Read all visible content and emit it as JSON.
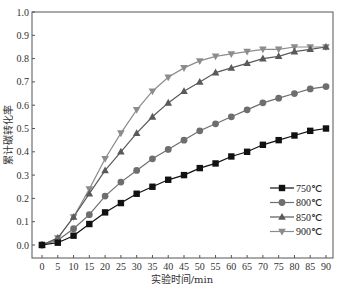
{
  "chart_data": {
    "type": "line",
    "title": "",
    "xlabel": "实验时间/min",
    "ylabel": "累计碳转化率",
    "xlim": [
      -2,
      92
    ],
    "ylim": [
      -0.05,
      1.0
    ],
    "xticks": [
      0,
      5,
      10,
      15,
      20,
      25,
      30,
      35,
      40,
      45,
      50,
      55,
      60,
      65,
      70,
      75,
      80,
      85,
      90
    ],
    "yticks": [
      0.0,
      0.1,
      0.2,
      0.3,
      0.4,
      0.5,
      0.6,
      0.7,
      0.8,
      0.9,
      1.0
    ],
    "ytick_labels": [
      "0.0",
      "0.1",
      "0.2",
      "0.3",
      "0.4",
      "0.5",
      "0.6",
      "0.7",
      "0.8",
      "0.9",
      "1.0"
    ],
    "grid": false,
    "legend_position": "bottom-right",
    "x": [
      0,
      5,
      10,
      15,
      20,
      25,
      30,
      35,
      40,
      45,
      50,
      55,
      60,
      65,
      70,
      75,
      80,
      85,
      90
    ],
    "series": [
      {
        "name": "750℃",
        "marker": "square",
        "color": "#111111",
        "values": [
          0.0,
          0.01,
          0.04,
          0.09,
          0.14,
          0.18,
          0.22,
          0.25,
          0.28,
          0.3,
          0.33,
          0.35,
          0.38,
          0.4,
          0.43,
          0.45,
          0.47,
          0.49,
          0.5
        ]
      },
      {
        "name": "800℃",
        "marker": "circle",
        "color": "#6e6e6e",
        "values": [
          0.0,
          0.02,
          0.07,
          0.13,
          0.21,
          0.27,
          0.32,
          0.37,
          0.41,
          0.45,
          0.49,
          0.52,
          0.55,
          0.58,
          0.61,
          0.63,
          0.65,
          0.67,
          0.68
        ]
      },
      {
        "name": "850℃",
        "marker": "triangle-up",
        "color": "#5a5a5a",
        "values": [
          0.0,
          0.03,
          0.12,
          0.22,
          0.32,
          0.4,
          0.48,
          0.55,
          0.61,
          0.66,
          0.7,
          0.74,
          0.76,
          0.78,
          0.8,
          0.81,
          0.83,
          0.84,
          0.85
        ]
      },
      {
        "name": "900℃",
        "marker": "triangle-down",
        "color": "#8c8c8c",
        "values": [
          0.0,
          0.03,
          0.12,
          0.24,
          0.37,
          0.48,
          0.58,
          0.66,
          0.72,
          0.76,
          0.79,
          0.81,
          0.82,
          0.83,
          0.84,
          0.84,
          0.85,
          0.85,
          0.85
        ]
      }
    ]
  }
}
